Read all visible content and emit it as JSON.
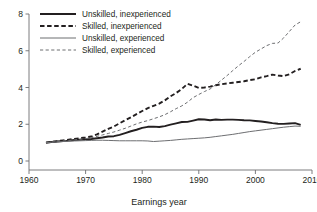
{
  "chart_data": {
    "type": "line",
    "title": "",
    "subtitle": "",
    "xlabel": "Earnings year",
    "ylabel": "",
    "xlim": [
      1960,
      2010
    ],
    "ylim": [
      0,
      8
    ],
    "xticks": [
      1960,
      1970,
      1980,
      1990,
      2000,
      2010
    ],
    "xtick_labels": [
      "1960",
      "1970",
      "1980",
      "1990",
      "2000",
      "2010"
    ],
    "yticks": [
      0,
      2,
      4,
      6,
      8
    ],
    "ytick_labels": [
      "0",
      "2",
      "4",
      "6",
      "8"
    ],
    "grid": false,
    "legend_position": "top-left",
    "x": [
      1963,
      1964,
      1965,
      1966,
      1967,
      1968,
      1969,
      1970,
      1971,
      1972,
      1973,
      1974,
      1975,
      1976,
      1977,
      1978,
      1979,
      1980,
      1981,
      1982,
      1983,
      1984,
      1985,
      1986,
      1987,
      1988,
      1989,
      1990,
      1991,
      1992,
      1993,
      1994,
      1995,
      1996,
      1997,
      1998,
      1999,
      2000,
      2001,
      2002,
      2003,
      2004,
      2005,
      2006,
      2007,
      2008
    ],
    "series": [
      {
        "name": "Unskilled, inexperienced",
        "color": "#231f20",
        "style": "solid",
        "width": 1.9,
        "values": [
          1.0,
          1.03,
          1.06,
          1.09,
          1.11,
          1.14,
          1.16,
          1.18,
          1.2,
          1.24,
          1.28,
          1.33,
          1.35,
          1.42,
          1.52,
          1.62,
          1.7,
          1.8,
          1.86,
          1.87,
          1.85,
          1.9,
          1.98,
          2.05,
          2.12,
          2.13,
          2.2,
          2.27,
          2.26,
          2.22,
          2.26,
          2.24,
          2.25,
          2.25,
          2.24,
          2.22,
          2.21,
          2.18,
          2.15,
          2.11,
          2.06,
          2.03,
          2.02,
          2.04,
          2.06,
          1.97
        ]
      },
      {
        "name": "Skilled, inexperienced",
        "color": "#231f20",
        "style": "dashed",
        "width": 1.9,
        "values": [
          1.0,
          1.04,
          1.08,
          1.12,
          1.16,
          1.2,
          1.24,
          1.28,
          1.33,
          1.45,
          1.6,
          1.75,
          1.88,
          2.05,
          2.22,
          2.38,
          2.55,
          2.72,
          2.88,
          3.0,
          3.12,
          3.3,
          3.52,
          3.7,
          3.92,
          4.2,
          4.1,
          3.98,
          4.0,
          4.05,
          4.12,
          4.18,
          4.22,
          4.26,
          4.3,
          4.34,
          4.4,
          4.45,
          4.55,
          4.62,
          4.7,
          4.65,
          4.62,
          4.72,
          4.9,
          5.02
        ]
      },
      {
        "name": "Unskilled, experienced",
        "color": "#6d6e71",
        "style": "solid",
        "width": 1.0,
        "values": [
          1.0,
          1.02,
          1.04,
          1.06,
          1.08,
          1.09,
          1.1,
          1.11,
          1.12,
          1.13,
          1.13,
          1.12,
          1.11,
          1.1,
          1.1,
          1.1,
          1.1,
          1.1,
          1.09,
          1.06,
          1.08,
          1.1,
          1.12,
          1.15,
          1.18,
          1.2,
          1.22,
          1.24,
          1.26,
          1.29,
          1.33,
          1.37,
          1.41,
          1.45,
          1.5,
          1.55,
          1.6,
          1.64,
          1.68,
          1.72,
          1.76,
          1.8,
          1.84,
          1.87,
          1.9,
          1.89
        ]
      },
      {
        "name": "Skilled, experienced",
        "color": "#6d6e71",
        "style": "dashed",
        "width": 1.0,
        "values": [
          1.0,
          1.03,
          1.06,
          1.09,
          1.12,
          1.15,
          1.18,
          1.22,
          1.26,
          1.34,
          1.42,
          1.5,
          1.58,
          1.68,
          1.78,
          1.9,
          2.02,
          2.12,
          2.2,
          2.3,
          2.4,
          2.52,
          2.68,
          2.85,
          3.0,
          3.2,
          3.45,
          3.62,
          3.78,
          3.92,
          4.15,
          4.4,
          4.65,
          4.92,
          5.18,
          5.42,
          5.68,
          5.92,
          6.1,
          6.28,
          6.4,
          6.42,
          6.7,
          7.05,
          7.4,
          7.58
        ]
      }
    ],
    "legend_entries": [
      {
        "label": "Unskilled, inexperienced",
        "color": "#231f20",
        "style": "solid",
        "width": 1.9
      },
      {
        "label": "Skilled, inexperienced",
        "color": "#231f20",
        "style": "dashed",
        "width": 1.9
      },
      {
        "label": "Unskilled, experienced",
        "color": "#6d6e71",
        "style": "solid",
        "width": 1.0
      },
      {
        "label": "Skilled, experienced",
        "color": "#6d6e71",
        "style": "dashed",
        "width": 1.0
      }
    ]
  }
}
